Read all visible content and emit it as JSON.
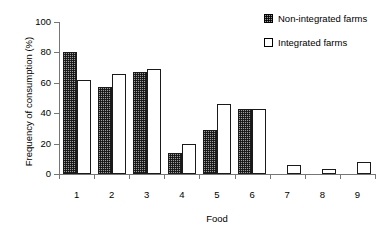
{
  "chart_data": {
    "type": "bar",
    "title": "",
    "xlabel": "Food",
    "ylabel": "Frequency of consumption (%)",
    "categories": [
      "1",
      "2",
      "3",
      "4",
      "5",
      "6",
      "7",
      "8",
      "9"
    ],
    "ylim": [
      0,
      100
    ],
    "yticks": [
      0,
      20,
      40,
      60,
      80,
      100
    ],
    "grid": false,
    "legend_position": "top-right",
    "series": [
      {
        "name": "Non-integrated farms",
        "fill": "checkered-pattern",
        "color": "#9e9e9e",
        "values": [
          80,
          57,
          67,
          14,
          29,
          43,
          0,
          0,
          0
        ]
      },
      {
        "name": "Integrated farms",
        "fill": "solid-white",
        "color": "#ffffff",
        "values": [
          62,
          66,
          69,
          20,
          46,
          43,
          6,
          3,
          8
        ]
      }
    ]
  },
  "legend": {
    "entries": [
      {
        "label": "Non-integrated farms"
      },
      {
        "label": "Integrated farms"
      }
    ]
  },
  "axes": {
    "y_title": "Frequency of consumption (%)",
    "x_title": "Food",
    "y_tick_labels": [
      "0",
      "20",
      "40",
      "60",
      "80",
      "100"
    ],
    "x_tick_labels": [
      "1",
      "2",
      "3",
      "4",
      "5",
      "6",
      "7",
      "8",
      "9"
    ]
  }
}
